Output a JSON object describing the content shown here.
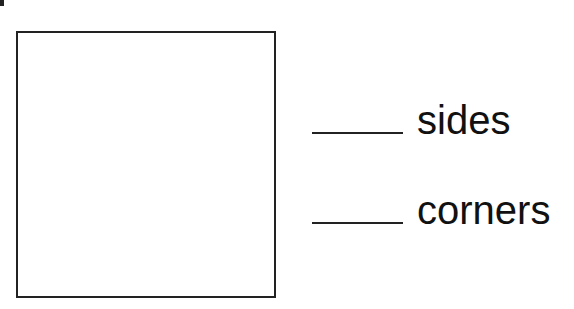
{
  "worksheet": {
    "shape": "square",
    "fields": [
      {
        "label": "sides",
        "value": ""
      },
      {
        "label": "corners",
        "value": ""
      }
    ]
  }
}
